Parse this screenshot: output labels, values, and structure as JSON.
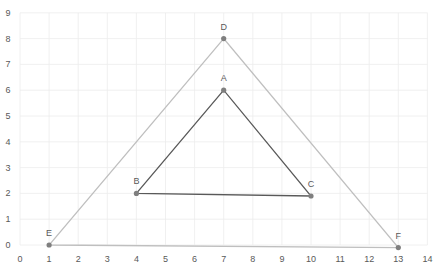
{
  "chart_data": {
    "type": "scatter",
    "title": "",
    "xlabel": "",
    "ylabel": "",
    "xlim": [
      0,
      14
    ],
    "ylim": [
      0,
      9
    ],
    "x_ticks": [
      "0",
      "1",
      "2",
      "3",
      "4",
      "5",
      "6",
      "7",
      "8",
      "9",
      "10",
      "11",
      "12",
      "13",
      "14"
    ],
    "y_ticks": [
      "0",
      "1",
      "2",
      "3",
      "4",
      "5",
      "6",
      "7",
      "8",
      "9"
    ],
    "grid": true,
    "legend": null,
    "series": [
      {
        "name": "Inner triangle ABC",
        "color": "#595959",
        "closed": true,
        "points": [
          {
            "label": "A",
            "x": 7,
            "y": 6
          },
          {
            "label": "B",
            "x": 4,
            "y": 2
          },
          {
            "label": "C",
            "x": 10,
            "y": 1.9
          }
        ]
      },
      {
        "name": "Outer triangle DEF",
        "color": "#bfbfbf",
        "closed": true,
        "points": [
          {
            "label": "D",
            "x": 7,
            "y": 8
          },
          {
            "label": "E",
            "x": 1,
            "y": 0
          },
          {
            "label": "F",
            "x": 13,
            "y": -0.1
          }
        ]
      }
    ]
  }
}
